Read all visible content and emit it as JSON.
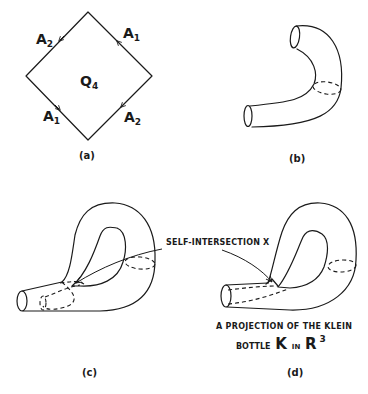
{
  "figure": {
    "panels": [
      {
        "id": "a",
        "label": "(a)",
        "description": "square identification diagram",
        "center_label": "Q",
        "center_label_sub": "4",
        "edges": [
          {
            "position": "upper-left",
            "label": "A",
            "sub": "2"
          },
          {
            "position": "upper-right",
            "label": "A",
            "sub": "1"
          },
          {
            "position": "lower-left",
            "label": "A",
            "sub": "1"
          },
          {
            "position": "lower-right",
            "label": "A",
            "sub": "2"
          }
        ]
      },
      {
        "id": "b",
        "label": "(b)",
        "description": "bent tube (cylinder)"
      },
      {
        "id": "c",
        "label": "(c)",
        "description": "tube passing through its own wall"
      },
      {
        "id": "d",
        "label": "(d)",
        "description": "projection of the Klein bottle"
      }
    ],
    "annotation": {
      "self_intersection": "SELF-INTERSECTION X"
    },
    "caption": {
      "line1": "A PROJECTION OF THE KLEIN",
      "line2_prefix": "BOTTLE",
      "line2_K": "K",
      "line2_in": "IN",
      "line2_R": "R",
      "line2_sup": "3"
    },
    "colors": {
      "ink": "#1a1a1a",
      "background": "#ffffff"
    }
  }
}
